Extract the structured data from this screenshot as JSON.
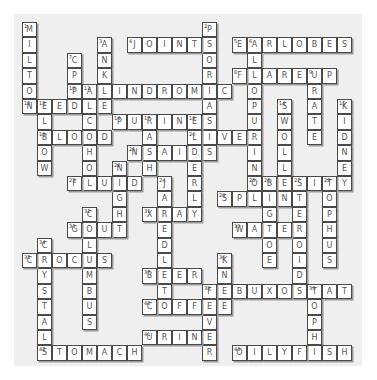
{
  "puzzle": {
    "type": "crossword",
    "grid": {
      "origin_x": 22,
      "origin_y": 22,
      "col_pitch": 15,
      "row_pitch": 15.4,
      "cols": 22,
      "rows": 22
    },
    "colors": {
      "background": "#efefef",
      "cell": "#ffffff",
      "border": "#4a4a4a",
      "letter": "#555555"
    },
    "words": [
      {
        "num": 1,
        "dir": "down",
        "row": 0,
        "col": 0,
        "answer": "MILTON"
      },
      {
        "num": 2,
        "dir": "down",
        "row": 0,
        "col": 12,
        "answer": "PSORIASIS"
      },
      {
        "num": 3,
        "dir": "down",
        "row": 1,
        "col": 5,
        "answer": "ANKLE"
      },
      {
        "num": 4,
        "dir": "across",
        "row": 1,
        "col": 7,
        "answer": "JOINTS"
      },
      {
        "num": 5,
        "dir": "across",
        "row": 1,
        "col": 14,
        "answer": "EARLOBES"
      },
      {
        "num": 6,
        "dir": "down",
        "row": 1,
        "col": 15,
        "answer": "ALLOPURINOL"
      },
      {
        "num": 7,
        "dir": "down",
        "row": 2,
        "col": 3,
        "answer": "CPPD"
      },
      {
        "num": 8,
        "dir": "across",
        "row": 3,
        "col": 14,
        "answer": "FLAREUP"
      },
      {
        "num": 9,
        "dir": "down",
        "row": 3,
        "col": 19,
        "answer": "URATE"
      },
      {
        "num": 10,
        "dir": "across",
        "row": 4,
        "col": 3,
        "answer": "PALINDROMIC"
      },
      {
        "num": 11,
        "dir": "down",
        "row": 4,
        "col": 4,
        "answer": "ALCOHOL"
      },
      {
        "num": 12,
        "dir": "across",
        "row": 5,
        "col": 0,
        "answer": "NEEDLE"
      },
      {
        "num": 13,
        "dir": "down",
        "row": 5,
        "col": 1,
        "answer": "ELBOW"
      },
      {
        "num": 14,
        "dir": "down",
        "row": 5,
        "col": 17,
        "answer": "SWOLLEN"
      },
      {
        "num": 15,
        "dir": "down",
        "row": 5,
        "col": 21,
        "answer": "KIDNEY"
      },
      {
        "num": 16,
        "dir": "across",
        "row": 6,
        "col": 6,
        "answer": "PURINES"
      },
      {
        "num": 17,
        "dir": "down",
        "row": 6,
        "col": 8,
        "answer": "RASH"
      },
      {
        "num": 18,
        "dir": "down",
        "row": 6,
        "col": 11,
        "answer": "ELDERLY"
      },
      {
        "num": 19,
        "dir": "across",
        "row": 7,
        "col": 1,
        "answer": "BLOOD"
      },
      {
        "num": 20,
        "dir": "across",
        "row": 7,
        "col": 11,
        "answer": "LIVER"
      },
      {
        "num": 21,
        "dir": "across",
        "row": 8,
        "col": 7,
        "answer": "NSAIDS"
      },
      {
        "num": 22,
        "dir": "down",
        "row": 9,
        "col": 6,
        "answer": "NIGHT"
      },
      {
        "num": 23,
        "dir": "across",
        "row": 10,
        "col": 3,
        "answer": "FLUID"
      },
      {
        "num": 24,
        "dir": "down",
        "row": 10,
        "col": 9,
        "answer": "JAREDLETO"
      },
      {
        "num": 25,
        "dir": "across",
        "row": 10,
        "col": 15,
        "answer": "OBESITY"
      },
      {
        "num": 26,
        "dir": "down",
        "row": 10,
        "col": 16,
        "answer": "BIGTOE"
      },
      {
        "num": 27,
        "dir": "down",
        "row": 10,
        "col": 18,
        "answer": "STEROIDS"
      },
      {
        "num": 28,
        "dir": "down",
        "row": 10,
        "col": 20,
        "answer": "TOPHUS"
      },
      {
        "num": 29,
        "dir": "across",
        "row": 11,
        "col": 13,
        "answer": "SPLINT"
      },
      {
        "num": 30,
        "dir": "across",
        "row": 13,
        "col": 14,
        "answer": "WATER"
      },
      {
        "num": 31,
        "dir": "across",
        "row": 12,
        "col": 8,
        "answer": "XRAY"
      },
      {
        "num": 32,
        "dir": "down",
        "row": 12,
        "col": 4,
        "answer": "COLUMBUS"
      },
      {
        "num": 33,
        "dir": "across",
        "row": 13,
        "col": 3,
        "answer": "GOUT"
      },
      {
        "num": 34,
        "dir": "down",
        "row": 14,
        "col": 1,
        "answer": "CRYSTALS"
      },
      {
        "num": 35,
        "dir": "across",
        "row": 15,
        "col": 0,
        "answer": "CROCUS"
      },
      {
        "num": 36,
        "dir": "down",
        "row": 15,
        "col": 13,
        "answer": "KNEE"
      },
      {
        "num": 37,
        "dir": "across",
        "row": 16,
        "col": 8,
        "answer": "BEER"
      },
      {
        "num": 38,
        "dir": "across",
        "row": 17,
        "col": 12,
        "answer": "FEBUXOSTAT"
      },
      {
        "num": 38,
        "dir": "down",
        "row": 17,
        "col": 12,
        "answer": "FEVER"
      },
      {
        "num": 39,
        "dir": "down",
        "row": 17,
        "col": 19,
        "answer": "TOPHI"
      },
      {
        "num": 40,
        "dir": "across",
        "row": 18,
        "col": 8,
        "answer": "COFFEE"
      },
      {
        "num": 41,
        "dir": "across",
        "row": 20,
        "col": 8,
        "answer": "URINE"
      },
      {
        "num": 42,
        "dir": "across",
        "row": 21,
        "col": 1,
        "answer": "STOMACH"
      },
      {
        "num": 43,
        "dir": "across",
        "row": 21,
        "col": 14,
        "answer": "OILYFISH"
      }
    ]
  }
}
